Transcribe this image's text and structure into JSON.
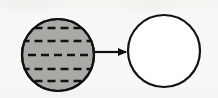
{
  "figure": {
    "type": "diagram",
    "canvas": {
      "width": 218,
      "height": 98,
      "background_color": "#f7f7f5"
    },
    "stroke_color": "#111111",
    "nodes": [
      {
        "id": "source-sphere",
        "label": "striped filled sphere",
        "shape": "circle",
        "cx": 58,
        "cy": 55,
        "r": 36,
        "fill_color": "#aba9a6",
        "stroke_color": "#111111",
        "stroke_width": 2.2,
        "pattern": "horizontal-dashed-rows",
        "dash_color": "#111111",
        "dash_rows": [
          {
            "y": 28,
            "dashes": 4,
            "dash_length": 8,
            "gap": 5
          },
          {
            "y": 41,
            "dashes": 6,
            "dash_length": 8,
            "gap": 5
          },
          {
            "y": 55,
            "dashes": 7,
            "dash_length": 8,
            "gap": 5
          },
          {
            "y": 69,
            "dashes": 6,
            "dash_length": 8,
            "gap": 5
          },
          {
            "y": 81,
            "dashes": 4,
            "dash_length": 8,
            "gap": 5
          }
        ]
      },
      {
        "id": "target-sphere",
        "label": "empty sphere",
        "shape": "circle",
        "cx": 164,
        "cy": 51,
        "r": 36,
        "fill_color": "#ffffff",
        "stroke_color": "#111111",
        "stroke_width": 2.2,
        "pattern": "none"
      }
    ],
    "connectors": [
      {
        "id": "transform-arrow",
        "label": "maps to",
        "type": "arrow",
        "from": "source-sphere",
        "to": "target-sphere",
        "x1": 95,
        "y1": 52,
        "x2": 127,
        "y2": 52,
        "stroke_color": "#111111",
        "stroke_width": 2.2,
        "head": "solid-triangle",
        "head_length": 9,
        "head_width": 8
      }
    ]
  }
}
